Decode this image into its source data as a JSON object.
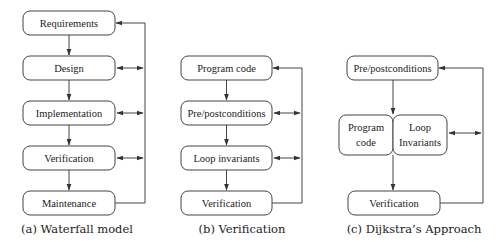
{
  "panels": [
    {
      "id": "a",
      "caption": "(a) Waterfall model",
      "boxes": [
        {
          "label": "Requirements"
        },
        {
          "label": "Design"
        },
        {
          "label": "Implementation"
        },
        {
          "label": "Verification"
        },
        {
          "label": "Maintenance"
        }
      ]
    },
    {
      "id": "b",
      "caption": "(b) Verification",
      "boxes": [
        {
          "label": "Program code"
        },
        {
          "label": "Pre/postconditions"
        },
        {
          "label": "Loop invariants"
        },
        {
          "label": "Verification"
        }
      ]
    },
    {
      "id": "c",
      "caption": "(c) Dijkstra’s Approach",
      "boxes": [
        {
          "label": "Pre/postconditions"
        },
        {
          "label_line1": "Program",
          "label_line2": "code"
        },
        {
          "label_line1": "Loop",
          "label_line2": "Invariants"
        },
        {
          "label": "Verification"
        }
      ]
    }
  ],
  "colors": {
    "stroke": "#444444",
    "text": "#222222",
    "background": "#ffffff"
  }
}
